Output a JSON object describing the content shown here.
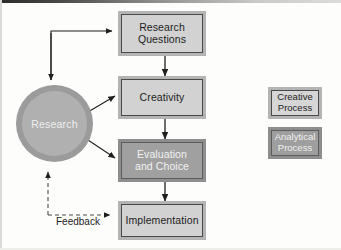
{
  "diagram": {
    "nodes": {
      "research_questions": {
        "label": "Research\nQuestions",
        "style": "creative"
      },
      "creativity": {
        "label": "Creativity",
        "style": "creative"
      },
      "evaluation": {
        "label": "Evaluation\nand Choice",
        "style": "analytical"
      },
      "implementation": {
        "label": "Implementation",
        "style": "creative"
      },
      "research_circle": {
        "label": "Research",
        "style": "circle"
      }
    },
    "edges": {
      "feedback_label": "Feedback"
    },
    "legend": {
      "creative": {
        "label": "Creative\nProcess",
        "style": "creative"
      },
      "analytical": {
        "label": "Analytical\nProcess",
        "style": "analytical"
      }
    },
    "colors": {
      "creative_fill": "#d2d2d2",
      "analytical_fill": "#a0a0a0",
      "frame": "#b4b4b4",
      "circle_ring": "#9b9b9b",
      "circle_fill": "#b0b0b0",
      "line": "#1f1f1f",
      "background": "#fdfdfc"
    }
  }
}
